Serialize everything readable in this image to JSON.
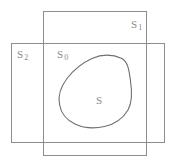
{
  "figure": {
    "kind": "set-diagram",
    "width": 174,
    "height": 164,
    "background_color": "#ffffff",
    "stroke_color": "#8c8c8c",
    "label_color": "#8a8a8a",
    "labels": {
      "s1_base": "S",
      "s1_sub": "1",
      "s2_base": "S",
      "s2_sub": "2",
      "s0_base": "S",
      "s0_sub": "0",
      "s_base": "S"
    },
    "regions": [
      {
        "name": "S1",
        "shape": "rectangle",
        "label_base": "S",
        "label_sub": "1",
        "x": 43,
        "y": 11,
        "w": 104,
        "h": 145
      },
      {
        "name": "S2",
        "shape": "rectangle",
        "label_base": "S",
        "label_sub": "2",
        "x": 11,
        "y": 43,
        "w": 154,
        "h": 100
      },
      {
        "name": "S0",
        "shape": "intersection-region",
        "label_base": "S",
        "label_sub": "0"
      },
      {
        "name": "S",
        "shape": "closed-curve",
        "label_base": "S",
        "label_sub": ""
      }
    ]
  }
}
